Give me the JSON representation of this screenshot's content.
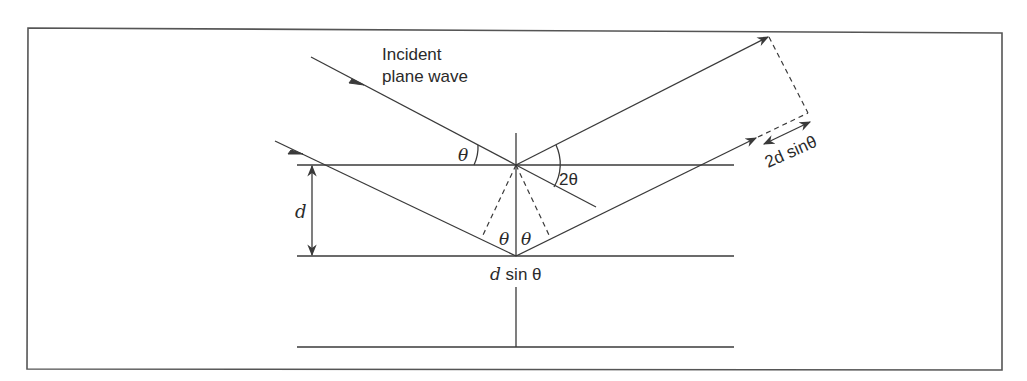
{
  "diagram": {
    "type": "bragg-diffraction",
    "labels": {
      "incident_line1": "Incident",
      "incident_line2": "plane wave",
      "theta_incident": "θ",
      "two_theta": "2θ",
      "d_spacing": "d",
      "theta_left": "θ",
      "theta_right": "θ",
      "d_sin_theta_d": "d",
      "d_sin_theta_rest": " sin θ",
      "path_diff_2d": "2d",
      "path_diff_sin": " sinθ"
    },
    "colors": {
      "line": "#3a3a3a",
      "frame": "#555555",
      "background": "#ffffff"
    }
  }
}
